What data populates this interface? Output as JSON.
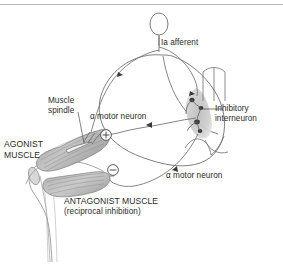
{
  "figure": {
    "background_color": "#ffffff",
    "line_color": "#4a4a4a",
    "text_color": "#2b2b2b",
    "gray_matter_color": "#c9c9c9",
    "muscle_color": "#b5b5b5"
  },
  "labels": {
    "ia_afferent": "Ia afferent",
    "muscle_spindle_line1": "Muscle",
    "muscle_spindle_line2": "spindle",
    "alpha_motor_neuron_upper": "α motor neuron",
    "alpha_motor_neuron_lower": "α motor neuron",
    "inhibitory_interneuron_line1": "Inhibitory",
    "inhibitory_interneuron_line2": "interneuron",
    "agonist_muscle_line1": "AGONIST",
    "agonist_muscle_line2": "MUSCLE",
    "antagonist_muscle": "ANTAGONIST MUSCLE",
    "reciprocal_inhibition": "(reciprocal inhibition)"
  },
  "symbols": {
    "excitatory": "+",
    "inhibitory": "−"
  }
}
